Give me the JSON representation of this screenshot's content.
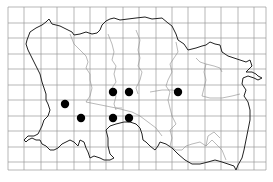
{
  "map": {
    "width": 273,
    "height": 182,
    "background": "#ffffff",
    "grid": {
      "x_lines": [
        8,
        24,
        41,
        57,
        74,
        90,
        106,
        123,
        139,
        156,
        172,
        188,
        205,
        221,
        238,
        254,
        266
      ],
      "y_lines": [
        7,
        23,
        38,
        54,
        69,
        85,
        100,
        116,
        131,
        147,
        162,
        170
      ],
      "color": "#9a9a9a"
    },
    "coastline_color": "#222222",
    "boundary_color": "#8a8a8a",
    "dot_color": "#000000",
    "dots": [
      {
        "x": 113,
        "y": 92
      },
      {
        "x": 129,
        "y": 92
      },
      {
        "x": 178,
        "y": 92
      },
      {
        "x": 65,
        "y": 104
      },
      {
        "x": 81,
        "y": 118
      },
      {
        "x": 113,
        "y": 118
      },
      {
        "x": 129,
        "y": 118
      }
    ]
  }
}
